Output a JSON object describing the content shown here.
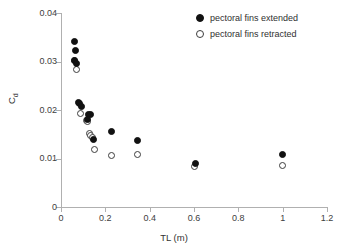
{
  "chart_data": {
    "type": "scatter",
    "title": "",
    "xlabel": "TL (m)",
    "ylabel": "Cd",
    "ylabel_base": "C",
    "ylabel_sub": "d",
    "xlim": [
      0,
      1.2
    ],
    "ylim": [
      0,
      0.04
    ],
    "grid": false,
    "legend_position": "top-right",
    "xticks": [
      "0",
      "0.2",
      "0.4",
      "0.6",
      "0.8",
      "1",
      "1.2"
    ],
    "xtick_values": [
      0,
      0.2,
      0.4,
      0.6,
      0.8,
      1.0,
      1.2
    ],
    "yticks": [
      "0",
      "0.01",
      "0.02",
      "0.03",
      "0.04"
    ],
    "ytick_values": [
      0,
      0.01,
      0.02,
      0.03,
      0.04
    ],
    "series": [
      {
        "name": "pectoral fins extended",
        "marker": "filled-circle",
        "color": "#111111",
        "points": [
          {
            "x": 0.06,
            "y": 0.0342
          },
          {
            "x": 0.065,
            "y": 0.0322
          },
          {
            "x": 0.062,
            "y": 0.0303
          },
          {
            "x": 0.068,
            "y": 0.0295
          },
          {
            "x": 0.078,
            "y": 0.0216
          },
          {
            "x": 0.082,
            "y": 0.0213
          },
          {
            "x": 0.092,
            "y": 0.0208
          },
          {
            "x": 0.122,
            "y": 0.019
          },
          {
            "x": 0.132,
            "y": 0.019
          },
          {
            "x": 0.118,
            "y": 0.018
          },
          {
            "x": 0.148,
            "y": 0.0139
          },
          {
            "x": 0.228,
            "y": 0.0156
          },
          {
            "x": 0.343,
            "y": 0.0137
          },
          {
            "x": 0.605,
            "y": 0.009
          },
          {
            "x": 1.0,
            "y": 0.0108
          }
        ]
      },
      {
        "name": "pectoral fins retracted",
        "marker": "open-circle",
        "color": "#3d3d3d",
        "points": [
          {
            "x": 0.063,
            "y": 0.0303
          },
          {
            "x": 0.068,
            "y": 0.0283
          },
          {
            "x": 0.09,
            "y": 0.0193
          },
          {
            "x": 0.115,
            "y": 0.0178
          },
          {
            "x": 0.12,
            "y": 0.0176
          },
          {
            "x": 0.128,
            "y": 0.0152
          },
          {
            "x": 0.135,
            "y": 0.0148
          },
          {
            "x": 0.142,
            "y": 0.0143
          },
          {
            "x": 0.15,
            "y": 0.0118
          },
          {
            "x": 0.228,
            "y": 0.0107
          },
          {
            "x": 0.343,
            "y": 0.0108
          },
          {
            "x": 0.602,
            "y": 0.0083
          },
          {
            "x": 1.0,
            "y": 0.0085
          }
        ]
      }
    ]
  },
  "legend": {
    "entries": [
      {
        "label": "pectoral fins extended",
        "marker": "filled-circle"
      },
      {
        "label": "pectoral fins retracted",
        "marker": "open-circle"
      }
    ]
  }
}
